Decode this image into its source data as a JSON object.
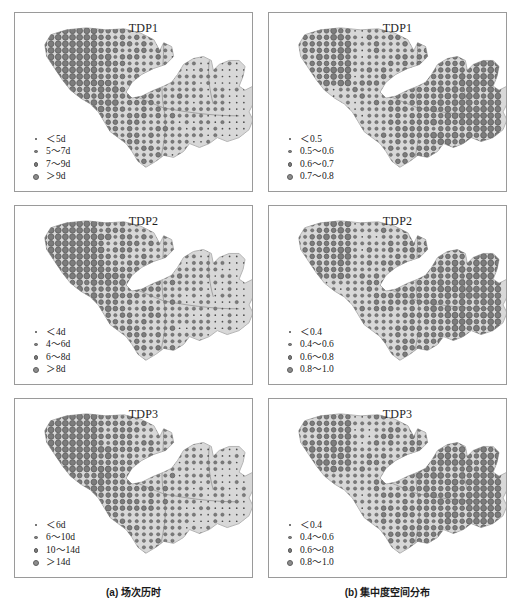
{
  "figure": {
    "type": "map-grid",
    "rows": 3,
    "columns": 2,
    "colors": {
      "panel_border": "#9a9a9a",
      "basin_fill": "#d8d8d8",
      "basin_outline": "#b4b4b4",
      "river_line": "#8a8a8a",
      "dot_fill": "#7c7c7c",
      "dot_stroke": "#5e5e5e",
      "background": "#ffffff",
      "text": "#1a1a1a"
    }
  },
  "captions": {
    "a": "(a) 场次历时",
    "b": "(b) 集中度空间分布"
  },
  "panels": [
    {
      "id": "a-tdp1",
      "column": "a",
      "row": 1,
      "title": "TDP1",
      "legend": [
        {
          "label": "＜5d",
          "size": 1
        },
        {
          "label": "5～7d",
          "size": 2
        },
        {
          "label": "7～9d",
          "size": 3
        },
        {
          "label": "＞9d",
          "size": 4
        }
      ]
    },
    {
      "id": "b-tdp1",
      "column": "b",
      "row": 1,
      "title": "TDP1",
      "legend": [
        {
          "label": "＜0.5",
          "size": 1
        },
        {
          "label": "0.5～0.6",
          "size": 2
        },
        {
          "label": "0.6～0.7",
          "size": 3
        },
        {
          "label": "0.7～0.8",
          "size": 4
        }
      ]
    },
    {
      "id": "a-tdp2",
      "column": "a",
      "row": 2,
      "title": "TDP2",
      "legend": [
        {
          "label": "＜4d",
          "size": 1
        },
        {
          "label": "4～6d",
          "size": 2
        },
        {
          "label": "6～8d",
          "size": 3
        },
        {
          "label": "＞8d",
          "size": 4
        }
      ]
    },
    {
      "id": "b-tdp2",
      "column": "b",
      "row": 2,
      "title": "TDP2",
      "legend": [
        {
          "label": "＜0.4",
          "size": 1
        },
        {
          "label": "0.4～0.6",
          "size": 2
        },
        {
          "label": "0.6～0.8",
          "size": 3
        },
        {
          "label": "0.8～1.0",
          "size": 4
        }
      ]
    },
    {
      "id": "a-tdp3",
      "column": "a",
      "row": 3,
      "title": "TDP3",
      "legend": [
        {
          "label": "＜6d",
          "size": 1
        },
        {
          "label": "6～10d",
          "size": 2
        },
        {
          "label": "10～14d",
          "size": 3
        },
        {
          "label": "＞14d",
          "size": 4
        }
      ]
    },
    {
      "id": "b-tdp3",
      "column": "b",
      "row": 3,
      "title": "TDP3",
      "legend": [
        {
          "label": "＜0.4",
          "size": 1
        },
        {
          "label": "0.4～0.6",
          "size": 2
        },
        {
          "label": "0.6～0.8",
          "size": 3
        },
        {
          "label": "0.8～1.0",
          "size": 4
        }
      ]
    }
  ],
  "chart_data": {
    "type": "scatter",
    "title": "",
    "xlabel": "",
    "ylabel": "",
    "grid": false,
    "legend_position": "bottom-left inside panel",
    "symbol_size_classes": [
      1,
      2,
      3,
      4
    ],
    "basin_outline": "M 36 22 L 52 17 L 72 15 L 92 17 L 110 16 L 126 20 L 140 27 L 146 38 L 150 30 L 158 34 L 160 44 L 152 52 L 140 56 L 128 62 L 118 70 L 112 80 L 118 86 L 128 84 L 140 78 L 150 74 L 158 70 L 164 62 L 170 52 L 180 46 L 190 44 L 198 48 L 200 58 L 206 52 L 216 48 L 226 48 L 232 54 L 230 64 L 226 74 L 232 78 L 240 74 L 250 74 L 256 80 L 250 88 L 240 92 L 236 100 L 240 108 L 236 118 L 226 126 L 214 130 L 204 126 L 196 132 L 186 136 L 176 132 L 170 140 L 160 146 L 150 144 L 142 150 L 132 156 L 124 150 L 118 140 L 112 132 L 104 126 L 96 120 L 90 110 L 84 100 L 76 92 L 66 86 L 56 78 L 48 68 L 40 56 L 32 44 L 30 32 Z",
    "dot_grid": {
      "spacing_x": 7.2,
      "spacing_y": 6.6,
      "origin_x": 22,
      "origin_y": 18
    },
    "series": [
      {
        "name": "TDP1 duration",
        "panel": "a-tdp1",
        "class_breaks": [
          "<5d",
          "5-7d",
          "7-9d",
          ">9d"
        ],
        "pattern": "largest symbols (>9d) concentrated in the northwest tail and western/southwestern basin; smallest symbols (<5d) dominate the eastern and northeastern basin"
      },
      {
        "name": "TDP1 concentration",
        "panel": "b-tdp1",
        "class_breaks": [
          "<0.5",
          "0.5-0.6",
          "0.6-0.7",
          "0.7-0.8"
        ],
        "pattern": "largest symbols (0.7-0.8) dominate the eastern and northeastern basin; smallest symbols (<0.5) appear in the central-west and the northwest tail interior"
      },
      {
        "name": "TDP2 duration",
        "panel": "a-tdp2",
        "class_breaks": [
          "<4d",
          "4-6d",
          "6-8d",
          ">8d"
        ],
        "pattern": "largest symbols (>8d) in the northwest tail and west-central basin; smallest symbols (<4d) across the east and southeast"
      },
      {
        "name": "TDP2 concentration",
        "panel": "b-tdp2",
        "class_breaks": [
          "<0.4",
          "0.4-0.6",
          "0.6-0.8",
          "0.8-1.0"
        ],
        "pattern": "large symbols (0.8-1.0) widespread over the northwest tail and the whole eastern basin; small symbols scattered in the central corridor"
      },
      {
        "name": "TDP3 duration",
        "panel": "a-tdp3",
        "class_breaks": [
          "<6d",
          "6-10d",
          "10-14d",
          ">14d"
        ],
        "pattern": "largest symbols (>14d) in the west and southwest; smallest symbols (<6d) in the north and east"
      },
      {
        "name": "TDP3 concentration",
        "panel": "b-tdp3",
        "class_breaks": [
          "<0.4",
          "0.4-0.6",
          "0.6-0.8",
          "0.8-1.0"
        ],
        "pattern": "largest symbols (0.8-1.0) cover the northwest tail and most of the eastern half; smallest symbols limited to a narrow central band"
      }
    ]
  }
}
